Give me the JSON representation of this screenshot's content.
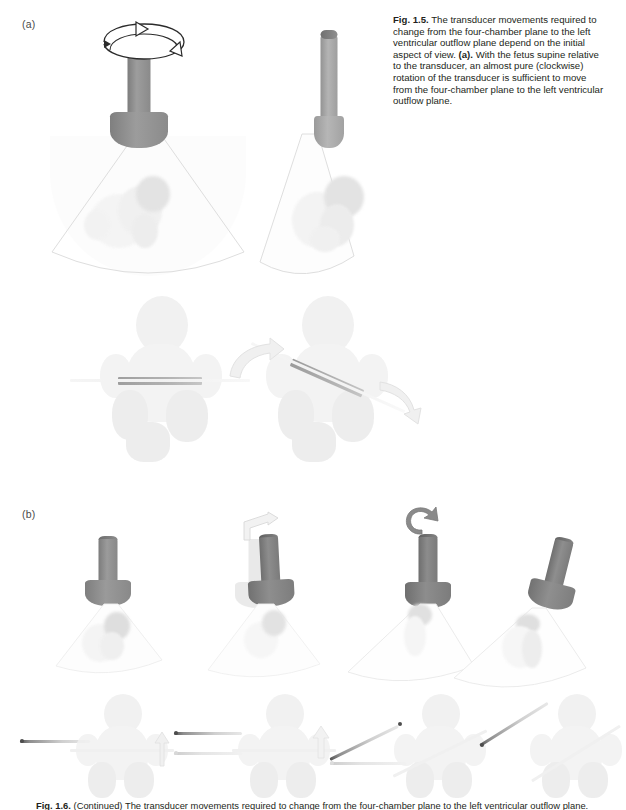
{
  "figure": {
    "panels": [
      {
        "id": "a",
        "label": "(a)"
      },
      {
        "id": "b",
        "label": "(b)"
      }
    ]
  },
  "caption": {
    "number": "Fig. 1.5.",
    "text_before_a": " The transducer movements required to change from the four-chamber plane to the left ventricular outflow plane depend on the initial aspect of view. ",
    "marker_a": "(a).",
    "text_after_a": " With the fetus supine relative to the transducer, an almost pure (clockwise) rotation of the transducer is sufficient to move from the four-chamber plane to the left ventricular outflow plane."
  },
  "bottom_caption": {
    "number": "Fig. 1.6.",
    "text": " (Continued) The transducer movements required to change from the four-chamber plane to the left ventricular outflow plane."
  },
  "panel_a": {
    "label": "(a)",
    "top_row": {
      "items": [
        {
          "name": "transducer-supine-front",
          "orientation_label": "front-facing",
          "rotation_arrow": "circular-rotation-arrow",
          "beam": "sector-beam",
          "target": "fetal-heart-four-chamber"
        },
        {
          "name": "transducer-rotated-edge",
          "orientation_label": "rotated-edge-on",
          "beam": "tilted-sector-beam",
          "target": "fetal-heart-outflow"
        }
      ]
    },
    "bottom_row": {
      "items": [
        {
          "name": "fetus-supine-horizontal-plane",
          "plane_angle_deg": 0,
          "arrows": []
        },
        {
          "name": "fetus-supine-rotated-plane",
          "plane_angle_deg": 24,
          "arrows": [
            "curved-arrow-left",
            "curved-arrow-right"
          ]
        }
      ]
    }
  },
  "panel_b": {
    "label": "(b)",
    "top_row": {
      "items": [
        {
          "name": "transducer-step-1",
          "tilt_deg": 0,
          "ghost": false,
          "arrow": "none"
        },
        {
          "name": "transducer-step-2",
          "tilt_deg": -7,
          "ghost": true,
          "arrow": "small-rotation-arrow"
        },
        {
          "name": "transducer-step-3",
          "tilt_deg": 0,
          "ghost": false,
          "arrow": "curved-c-arrow"
        },
        {
          "name": "transducer-step-4",
          "tilt_deg": 14,
          "ghost": false,
          "arrow": "none"
        }
      ]
    },
    "bottom_row": {
      "items": [
        {
          "name": "fetus-step-1",
          "bar_angle_deg": 0,
          "bar_position": "left-of-fetus"
        },
        {
          "name": "fetus-step-2",
          "bar_angle_deg": 0,
          "bar_position": "left-of-fetus",
          "has_up_arrow": true
        },
        {
          "name": "fetus-step-3",
          "bar_angle_deg": -26,
          "bar_position": "left-of-fetus",
          "has_up_arrow": true
        },
        {
          "name": "fetus-step-4",
          "bar_angle_deg": -32,
          "bar_position": "left-of-fetus"
        }
      ]
    }
  },
  "colors": {
    "transducer_body": "#8c8c8c",
    "transducer_dark": "#6f6f6f",
    "transducer_light": "#a8a8a8",
    "plane_bar": "#9a9a9a",
    "beam_outline": "#dcdcdc",
    "fetus_fill": "#f1f1f1",
    "text": "#231f20",
    "label": "#4a4a4a"
  }
}
